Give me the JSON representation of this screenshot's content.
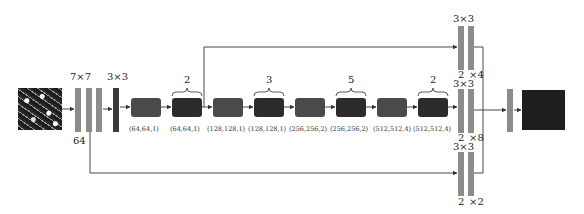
{
  "diagram": {
    "type": "network-architecture",
    "input": {
      "kind": "texture-image"
    },
    "stem": {
      "kernel_label": "7×7",
      "channels_label": "64"
    },
    "pool": {
      "kernel_label": "3×3"
    },
    "blocks": [
      {
        "label": "(64,64,1)",
        "repeat": null
      },
      {
        "label": "(64,64,1)",
        "repeat": "2"
      },
      {
        "label": "(128,128,1)",
        "repeat": null
      },
      {
        "label": "(128,128,1)",
        "repeat": "3"
      },
      {
        "label": "(256,256,2)",
        "repeat": null
      },
      {
        "label": "(256,256,2)",
        "repeat": "5"
      },
      {
        "label": "(512,512,4)",
        "repeat": null
      },
      {
        "label": "(512,512,4)",
        "repeat": "2"
      }
    ],
    "heads": [
      {
        "kernel_label": "3×3",
        "left_label": "2",
        "right_label": "×4"
      },
      {
        "kernel_label": "3×3",
        "left_label": "2",
        "right_label": "×8"
      },
      {
        "kernel_label": "3×3",
        "left_label": "2",
        "right_label": "×2"
      }
    ],
    "output": {
      "kind": "dark-square"
    },
    "colors": {
      "bar": "#8c8c8c",
      "block": "#4a4a4a",
      "dark": "#2c2c2c",
      "line": "#333333"
    }
  }
}
